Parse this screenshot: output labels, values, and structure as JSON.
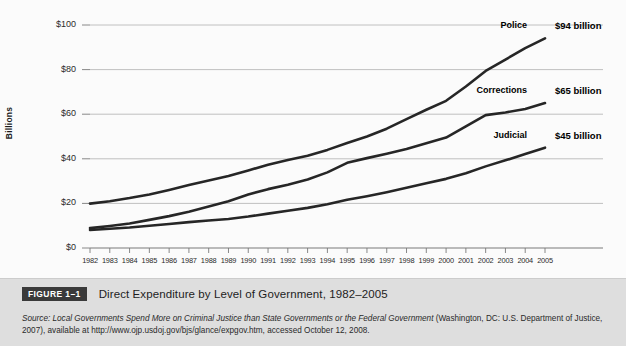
{
  "figure": {
    "badge": "FIGURE 1–1",
    "title": "Direct Expenditure by Level of Government, 1982–2005",
    "source_label": "Source:",
    "source_italic": "Local Governments Spend More on Criminal Justice than State Governments or the Federal Government",
    "source_rest": "(Washington, DC: U.S. Department of Justice, 2007), available at http://www.ojp.usdoj.gov/bjs/glance/expgov.htm, accessed October 12, 2008."
  },
  "colors": {
    "line": "#262626",
    "gridline": "#b9b9b9",
    "axis": "#7a7a7a",
    "chart_background": "#fbfbfb",
    "caption_background": "#dedede",
    "badge_background": "#3a3a3a",
    "text": "#1d1d1d"
  },
  "chart_data": {
    "type": "line",
    "title": "Direct Expenditure by Level of Government, 1982–2005",
    "xlabel": "",
    "ylabel": "Billions",
    "ylim": [
      0,
      100
    ],
    "yticks": [
      0,
      20,
      40,
      60,
      80,
      100
    ],
    "ytick_labels": [
      "$0",
      "$20",
      "$40",
      "$60",
      "$80",
      "$100"
    ],
    "grid": true,
    "legend_position": "inline-right",
    "x": [
      1982,
      1983,
      1984,
      1985,
      1986,
      1987,
      1988,
      1989,
      1990,
      1991,
      1992,
      1993,
      1994,
      1995,
      1996,
      1997,
      1998,
      1999,
      2000,
      2001,
      2002,
      2003,
      2004,
      2005
    ],
    "xtick_labels": [
      "1982",
      "1983",
      "1984",
      "1985",
      "1986",
      "1987",
      "1988",
      "1989",
      "1990",
      "1991",
      "1992",
      "1993",
      "1994",
      "1995",
      "1996",
      "1997",
      "1998",
      "1999",
      "2000",
      "2001",
      "2002",
      "2003",
      "2004",
      "2005"
    ],
    "series": [
      {
        "name": "Police",
        "end_label": "$94 billion",
        "end_value": 94,
        "values": [
          19.9,
          21.0,
          22.4,
          24.0,
          26.0,
          28.2,
          30.3,
          32.3,
          34.8,
          37.3,
          39.5,
          41.4,
          44.0,
          47.1,
          50.0,
          53.5,
          57.8,
          62.0,
          66.0,
          72.4,
          79.4,
          84.5,
          89.6,
          94.0
        ]
      },
      {
        "name": "Corrections",
        "end_label": "$65 billion",
        "end_value": 65,
        "values": [
          8.9,
          9.9,
          11.0,
          12.6,
          14.3,
          16.3,
          18.6,
          21.0,
          24.0,
          26.4,
          28.4,
          30.7,
          33.9,
          38.2,
          40.3,
          42.3,
          44.4,
          47.0,
          49.5,
          54.5,
          59.6,
          60.8,
          62.3,
          65.0
        ]
      },
      {
        "name": "Judicial",
        "end_label": "$45 billion",
        "end_value": 45,
        "values": [
          8.1,
          8.6,
          9.2,
          10.0,
          10.8,
          11.6,
          12.3,
          13.0,
          14.1,
          15.4,
          16.7,
          18.0,
          19.6,
          21.6,
          23.2,
          25.0,
          27.0,
          29.0,
          31.0,
          33.5,
          36.6,
          39.3,
          42.2,
          45.0
        ]
      }
    ]
  }
}
